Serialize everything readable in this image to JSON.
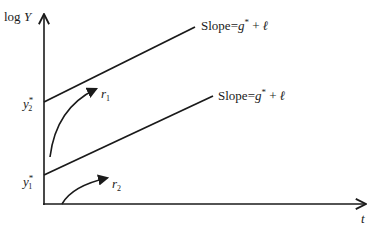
{
  "diagram": {
    "y_axis": {
      "label_prefix": "log",
      "label_var": "Y"
    },
    "x_axis": {
      "label": "t"
    },
    "lines": [
      {
        "id": "upper",
        "intercept_label_base": "y",
        "intercept_label_sub": "2",
        "intercept_label_sup": "*",
        "slope_label_word": "Slope",
        "slope_label_eq": "=",
        "slope_label_g": "g",
        "slope_label_star": "*",
        "slope_label_plus": "+",
        "slope_label_l": "ℓ"
      },
      {
        "id": "lower",
        "intercept_label_base": "y",
        "intercept_label_sub": "1",
        "intercept_label_sup": "*",
        "slope_label_word": "Slope",
        "slope_label_eq": "=",
        "slope_label_g": "g",
        "slope_label_star": "*",
        "slope_label_plus": "+",
        "slope_label_l": "ℓ"
      }
    ],
    "arrows": [
      {
        "id": "r1",
        "label_base": "r",
        "label_sub": "1"
      },
      {
        "id": "r2",
        "label_base": "r",
        "label_sub": "2"
      }
    ],
    "colors": {
      "ink": "#1a1a1a",
      "background": "#ffffff"
    }
  }
}
